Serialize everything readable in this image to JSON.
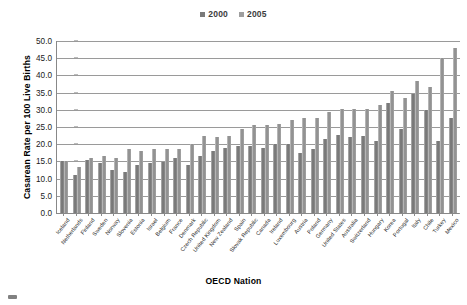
{
  "chart_data": {
    "type": "bar",
    "title": "",
    "xlabel": "OECD Nation",
    "ylabel": "Casarean Rate per 100 Live Births",
    "ylim": [
      0.0,
      50.0
    ],
    "ytick_step": 5.0,
    "ytick_labels": [
      "0.0",
      "5.0",
      "10.0",
      "15.0",
      "20.0",
      "25.0",
      "30.0",
      "35.0",
      "40.0",
      "45.0",
      "50.0"
    ],
    "grid": true,
    "legend_position": "top-center",
    "categories": [
      "Iceland",
      "Netherlands",
      "Finland",
      "Sweden",
      "Norway",
      "Slovenia",
      "Estonia",
      "Israel",
      "Belgium",
      "France",
      "Denmark",
      "Czech Republic",
      "United Kingdom",
      "New Zealand",
      "Spain",
      "Slovak Republic",
      "Canada",
      "Ireland",
      "Luxembourg",
      "Austria",
      "Poland",
      "Germany",
      "United States",
      "Australia",
      "Switzerland",
      "Hungary",
      "Korea",
      "Portugal",
      "Italy",
      "Chile",
      "Turkey",
      "Mexico"
    ],
    "series": [
      {
        "name": "2000",
        "color": "#7a7a7a",
        "values": [
          15.0,
          11.0,
          15.5,
          14.5,
          12.5,
          12.0,
          14.0,
          14.5,
          14.8,
          16.0,
          14.0,
          16.5,
          18.0,
          19.0,
          19.5,
          19.5,
          19.0,
          20.0,
          20.0,
          17.5,
          18.5,
          21.5,
          22.8,
          22.0,
          22.5,
          21.0,
          32.0,
          24.5,
          34.5,
          30.0,
          21.0,
          27.5
        ]
      },
      {
        "name": "2005",
        "color": "#999999",
        "values": [
          15.1,
          13.5,
          16.0,
          16.5,
          16.0,
          18.5,
          18.0,
          18.5,
          18.5,
          18.5,
          20.0,
          22.5,
          22.0,
          22.5,
          24.5,
          25.5,
          25.5,
          26.0,
          27.0,
          27.5,
          27.5,
          29.5,
          30.3,
          30.3,
          30.3,
          31.5,
          35.5,
          33.5,
          38.5,
          36.5,
          45.0,
          48.0
        ]
      }
    ]
  },
  "legend": {
    "entries": [
      {
        "label": "2000",
        "color": "#7a7a7a"
      },
      {
        "label": "2005",
        "color": "#9e9e9e"
      }
    ]
  },
  "axes": {
    "y_title": "Casarean Rate per 100 Live Births",
    "x_title": "OECD Nation"
  }
}
